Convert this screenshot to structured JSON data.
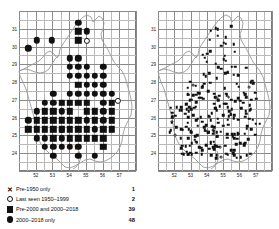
{
  "figure": {
    "type": "distribution-map-pair",
    "panels": [
      {
        "id": "left",
        "axis": {
          "x_ticks": [
            "52",
            "53",
            "54",
            "55",
            "56",
            "57"
          ],
          "y_ticks": [
            "31",
            "30",
            "29",
            "28",
            "27",
            "26",
            "25",
            "24"
          ],
          "x_range": [
            51,
            58
          ],
          "y_range": [
            23,
            32
          ]
        },
        "legend": [
          {
            "symbol": "cross",
            "label": "Pre-1950 only",
            "count": "1"
          },
          {
            "symbol": "open-circle",
            "label": "Last seen 1950–1999",
            "count": "2"
          },
          {
            "symbol": "filled-square",
            "label": "Pre-2000 and 2000–2018",
            "count": "39"
          },
          {
            "symbol": "filled-circle",
            "label": "2000–2018 only",
            "count": "48"
          }
        ]
      },
      {
        "id": "right",
        "axis": {
          "x_ticks": [
            "52",
            "53",
            "54",
            "55",
            "56",
            "57"
          ],
          "y_ticks": [
            "31",
            "30",
            "29",
            "28",
            "27",
            "26",
            "25",
            "24"
          ],
          "x_range": [
            51,
            58
          ],
          "y_range": [
            23,
            32
          ]
        },
        "legend": [
          {
            "symbol": "open-circle",
            "label": "Last seen pre-2000",
            "count": "11"
          },
          {
            "symbol": "filled-circle",
            "label": "Seen 2000–2018",
            "count": "237"
          }
        ]
      }
    ]
  },
  "chart_data": {
    "type": "scatter",
    "title": "",
    "xlabel": "",
    "ylabel": "",
    "xlim": [
      51,
      58
    ],
    "ylim": [
      23,
      32
    ],
    "grid": true,
    "legend_position": "below",
    "panels": [
      {
        "name": "left",
        "cell_size": 0.5,
        "series": [
          {
            "name": "Pre-1950 only",
            "symbol": "cross",
            "count": 1,
            "points": [
              [
                54.45,
                24.35
              ]
            ]
          },
          {
            "name": "Last seen 1950–1999",
            "symbol": "open-circle",
            "count": 2,
            "points": [
              [
                55.05,
                30.3
              ],
              [
                56.9,
                26.95
              ]
            ]
          },
          {
            "name": "Pre-2000 and 2000–2018",
            "symbol": "filled-square",
            "count": 39,
            "points": [
              [
                54.55,
                30.85
              ],
              [
                54.55,
                30.35
              ],
              [
                54.55,
                27.85
              ],
              [
                53.55,
                26.85
              ],
              [
                54.05,
                26.85
              ],
              [
                54.55,
                26.85
              ],
              [
                55.05,
                26.85
              ],
              [
                56.55,
                26.85
              ],
              [
                53.05,
                26.35
              ],
              [
                55.55,
                26.35
              ],
              [
                56.55,
                26.35
              ],
              [
                52.55,
                25.85
              ],
              [
                53.05,
                25.85
              ],
              [
                53.55,
                25.85
              ],
              [
                54.05,
                25.85
              ],
              [
                54.55,
                25.85
              ],
              [
                55.55,
                25.85
              ],
              [
                56.55,
                25.85
              ],
              [
                51.55,
                25.35
              ],
              [
                52.05,
                25.35
              ],
              [
                52.55,
                25.35
              ],
              [
                53.05,
                25.35
              ],
              [
                53.55,
                25.35
              ],
              [
                54.05,
                25.35
              ],
              [
                54.55,
                25.35
              ],
              [
                55.05,
                25.35
              ],
              [
                56.05,
                25.35
              ],
              [
                56.55,
                25.35
              ],
              [
                53.05,
                24.85
              ],
              [
                54.05,
                24.85
              ],
              [
                54.55,
                24.85
              ],
              [
                55.05,
                24.85
              ],
              [
                55.55,
                24.85
              ],
              [
                56.05,
                24.85
              ],
              [
                56.05,
                24.35
              ],
              [
                52.55,
                26.35
              ],
              [
                54.05,
                26.35
              ],
              [
                55.05,
                26.35
              ],
              [
                52.05,
                25.85
              ]
            ]
          },
          {
            "name": "2000–2018 only",
            "symbol": "filled-circle",
            "count": 48,
            "points": [
              [
                54.55,
                31.35
              ],
              [
                55.05,
                30.85
              ],
              [
                52.05,
                30.35
              ],
              [
                52.95,
                30.35
              ],
              [
                51.55,
                29.9
              ],
              [
                54.05,
                29.35
              ],
              [
                54.55,
                29.35
              ],
              [
                54.05,
                28.85
              ],
              [
                54.55,
                28.85
              ],
              [
                55.05,
                28.85
              ],
              [
                56.05,
                28.85
              ],
              [
                54.05,
                28.35
              ],
              [
                54.55,
                28.35
              ],
              [
                55.05,
                28.35
              ],
              [
                55.55,
                28.35
              ],
              [
                56.05,
                28.35
              ],
              [
                55.05,
                27.85
              ],
              [
                55.55,
                27.85
              ],
              [
                56.05,
                27.85
              ],
              [
                53.05,
                27.35
              ],
              [
                54.05,
                27.35
              ],
              [
                54.55,
                27.35
              ],
              [
                55.05,
                27.35
              ],
              [
                55.55,
                27.35
              ],
              [
                56.05,
                27.35
              ],
              [
                56.55,
                27.35
              ],
              [
                53.05,
                26.85
              ],
              [
                56.05,
                26.85
              ],
              [
                52.55,
                26.85
              ],
              [
                53.55,
                26.35
              ],
              [
                56.05,
                26.35
              ],
              [
                53.55,
                25.35
              ],
              [
                55.55,
                25.35
              ],
              [
                53.55,
                24.85
              ],
              [
                52.55,
                24.85
              ],
              [
                53.05,
                24.35
              ],
              [
                53.55,
                24.35
              ],
              [
                54.05,
                24.35
              ],
              [
                52.55,
                24.35
              ],
              [
                53.05,
                23.85
              ],
              [
                55.55,
                23.85
              ],
              [
                52.05,
                26.35
              ],
              [
                51.55,
                25.85
              ],
              [
                55.05,
                25.85
              ],
              [
                56.05,
                25.85
              ],
              [
                54.55,
                24.35
              ],
              [
                52.05,
                24.85
              ],
              [
                54.55,
                23.85
              ]
            ]
          }
        ]
      },
      {
        "name": "right",
        "cell_size": 0.1,
        "series": [
          {
            "name": "Last seen pre-2000",
            "symbol": "open-circle",
            "count": 11
          },
          {
            "name": "Seen 2000–2018",
            "symbol": "filled-circle",
            "count": 237
          }
        ]
      }
    ]
  }
}
